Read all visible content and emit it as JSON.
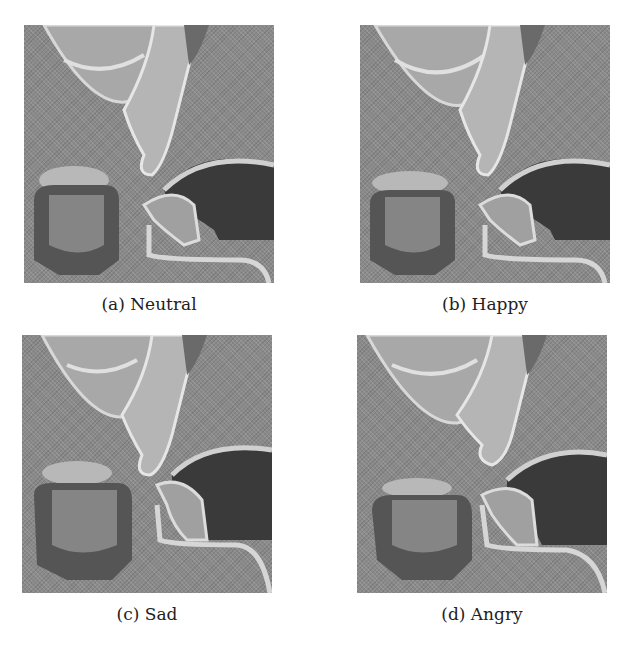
{
  "figure": {
    "panels": [
      {
        "id": "a",
        "label": "(a) Neutral",
        "emotion": "Neutral"
      },
      {
        "id": "b",
        "label": "(b) Happy",
        "emotion": "Happy"
      },
      {
        "id": "c",
        "label": "(c) Sad",
        "emotion": "Sad"
      },
      {
        "id": "d",
        "label": "(d) Angry",
        "emotion": "Angry"
      }
    ],
    "panel_content": [
      "lips",
      "nose-and-palate-profile",
      "oral-cavity",
      "tongue"
    ],
    "colors": {
      "background": "#ffffff",
      "panel_gray": "#8a8a8a",
      "highlight": "#e6e6e6",
      "shadow": "#2e2e2e"
    }
  }
}
